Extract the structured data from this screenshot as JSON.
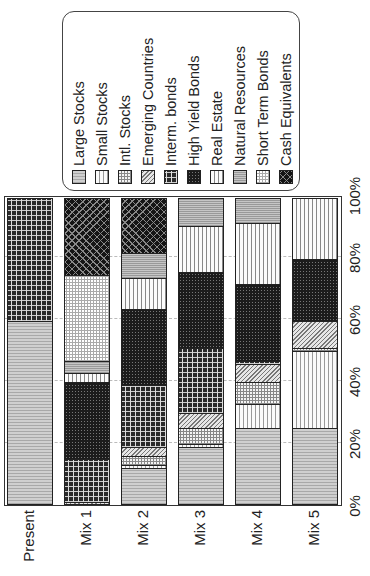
{
  "chart_data": {
    "type": "bar",
    "orientation": "stacked-100-percent",
    "rendered_rotation_deg": -90,
    "title": "",
    "xlabel": "",
    "ylabel": "",
    "ylim": [
      0,
      100
    ],
    "ticks": [
      "0%",
      "20%",
      "40%",
      "60%",
      "80%",
      "100%"
    ],
    "categories": [
      "Present",
      "Mix 1",
      "Mix 2",
      "Mix 3",
      "Mix 4",
      "Mix 5"
    ],
    "series": [
      {
        "name": "Large Stocks",
        "pattern": "p-large",
        "values": [
          60,
          0,
          12,
          19,
          25,
          25
        ]
      },
      {
        "name": "Small Stocks",
        "pattern": "p-small",
        "values": [
          0,
          0,
          1,
          1,
          8,
          25
        ]
      },
      {
        "name": "Intl. Stocks",
        "pattern": "p-intl",
        "values": [
          0,
          0,
          3,
          5,
          7,
          1
        ]
      },
      {
        "name": "Emerging Countries",
        "pattern": "p-emerg",
        "values": [
          0,
          1,
          3,
          5,
          6,
          9
        ]
      },
      {
        "name": "Interm. bonds",
        "pattern": "p-interm",
        "values": [
          40,
          14,
          20,
          21,
          1,
          0
        ]
      },
      {
        "name": "High Yield Bonds",
        "pattern": "p-hy",
        "values": [
          0,
          25,
          25,
          25,
          25,
          20
        ]
      },
      {
        "name": "Real Estate",
        "pattern": "p-re",
        "values": [
          0,
          3,
          10,
          15,
          20,
          20
        ]
      },
      {
        "name": "Natural Resources",
        "pattern": "p-nr",
        "values": [
          0,
          4,
          8,
          9,
          8,
          0
        ]
      },
      {
        "name": "Short Term Bonds",
        "pattern": "p-stb",
        "values": [
          0,
          28,
          0,
          0,
          0,
          0
        ]
      },
      {
        "name": "Cash Equivalents",
        "pattern": "p-cash",
        "values": [
          0,
          25,
          18,
          0,
          0,
          0
        ]
      }
    ],
    "legend_position": "top-right (rendered)",
    "grid": true
  },
  "legend": {
    "items": [
      "Large Stocks",
      "Small Stocks",
      "Intl. Stocks",
      "Emerging Countries",
      "Interm. bonds",
      "High Yield Bonds",
      "Real Estate",
      "Natural Resources",
      "Short Term Bonds",
      "Cash Equivalents"
    ]
  }
}
